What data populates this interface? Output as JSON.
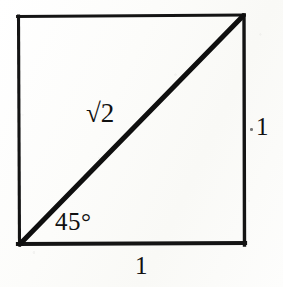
{
  "figure": {
    "background_color": "#fdfdfb",
    "ink_color": "#111111"
  },
  "labels": {
    "hypotenuse": "√2",
    "hypotenuse_plain": "sqrt(2)",
    "angle": "45°",
    "right_side": "1",
    "bottom_side": "1"
  },
  "geometry": {
    "square": {
      "top_left": [
        18,
        16
      ],
      "top_right": [
        244,
        15
      ],
      "bottom_right": [
        244,
        244
      ],
      "bottom_left": [
        19,
        244
      ],
      "side_length_label": "1",
      "stroke_width": 3.2
    },
    "diagonal": {
      "from": [
        19,
        244
      ],
      "to": [
        244,
        15
      ],
      "label": "√2",
      "stroke_width": 5.0
    },
    "angle_marked": {
      "at_vertex": [
        19,
        244
      ],
      "value_degrees": 45,
      "label": "45°"
    }
  }
}
